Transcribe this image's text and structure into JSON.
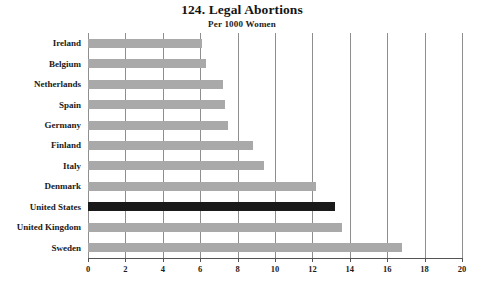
{
  "chart_data": {
    "type": "bar",
    "orientation": "horizontal",
    "title": "124. Legal Abortions",
    "subtitle": "Per 1000 Women",
    "xlabel": "",
    "ylabel": "",
    "categories": [
      "Ireland",
      "Belgium",
      "Netherlands",
      "Spain",
      "Germany",
      "Finland",
      "Italy",
      "Denmark",
      "United States",
      "United Kingdom",
      "Sweden"
    ],
    "values": [
      6.1,
      6.3,
      7.2,
      7.3,
      7.5,
      8.8,
      9.4,
      12.2,
      13.2,
      13.6,
      16.8
    ],
    "highlight_category": "United States",
    "xlim": [
      0,
      20
    ],
    "xticks": [
      0,
      2,
      4,
      6,
      8,
      10,
      12,
      14,
      16,
      18,
      20
    ],
    "xtick_labels": [
      "0",
      "2",
      "4",
      "6",
      "8",
      "10",
      "12",
      "14",
      "16",
      "18",
      "20"
    ],
    "grid": "vertical",
    "legend": "none",
    "colors": {
      "bar": "#a9a9a9",
      "highlight_bar": "#1a1a1a",
      "gridline": "#8e8e8e",
      "axis": "#555555",
      "text": "#1a1a1a",
      "background": "#ffffff"
    }
  }
}
